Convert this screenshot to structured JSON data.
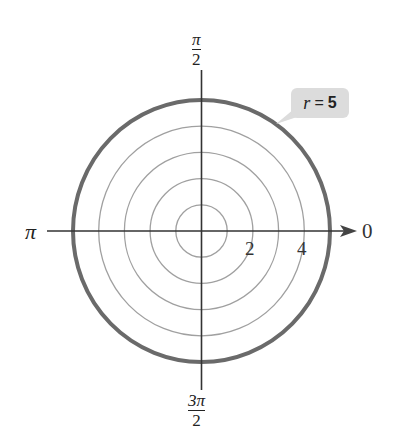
{
  "figure": {
    "callout": {
      "var": "r",
      "eq": "=",
      "value": "5"
    },
    "angle_labels": {
      "right": "0",
      "top": {
        "num": "π",
        "den": "2"
      },
      "left": "π",
      "bottom": {
        "num": "3π",
        "den": "2"
      }
    },
    "radial_tick_labels": [
      "2",
      "4"
    ],
    "grid_circle_radii": [
      1,
      2,
      3,
      4
    ],
    "highlight_circle_radius": 5,
    "colors": {
      "grid": "#9a9a9a",
      "curve": "#666666",
      "axis": "#333333",
      "callout_bg": "#dcdcdc"
    }
  }
}
